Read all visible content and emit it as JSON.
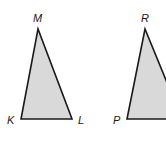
{
  "diagram": {
    "colors": {
      "fill": "#d9d9d9",
      "stroke": "#1a1a1a",
      "background": "#ffffff"
    },
    "triangles": [
      {
        "name": "triangle-KLM",
        "vertices": [
          {
            "label": "K",
            "x": 21,
            "y": 119,
            "lx": 8,
            "ly": 124
          },
          {
            "label": "L",
            "x": 72,
            "y": 119,
            "lx": 78,
            "ly": 124
          },
          {
            "label": "M",
            "x": 38,
            "y": 29,
            "lx": 33,
            "ly": 22
          }
        ]
      },
      {
        "name": "triangle-PQR",
        "vertices": [
          {
            "label": "P",
            "x": 127,
            "y": 119,
            "lx": 113,
            "ly": 124
          },
          {
            "label": "Q",
            "x": 182,
            "y": 119,
            "lx": 188,
            "ly": 124
          },
          {
            "label": "R",
            "x": 145,
            "y": 29,
            "lx": 141,
            "ly": 22
          }
        ]
      }
    ],
    "labels": {
      "K": "K",
      "L": "L",
      "M": "M",
      "P": "P",
      "R": "R"
    }
  }
}
